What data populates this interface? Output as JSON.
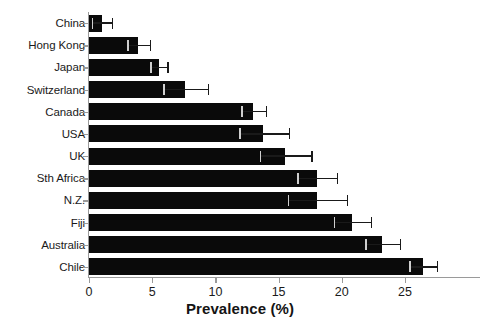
{
  "chart_data": {
    "type": "bar",
    "orientation": "horizontal",
    "title": "",
    "xlabel": "Prevalence (%)",
    "ylabel": "",
    "xlim": [
      0,
      28
    ],
    "ylim": null,
    "grid": false,
    "legend": null,
    "xticks": [
      0,
      5,
      10,
      15,
      20,
      25
    ],
    "xtick_labels": [
      "0",
      "5",
      "10",
      "15",
      "20",
      "25"
    ],
    "categories": [
      "China",
      "Hong Kong",
      "Japan",
      "Switzerland",
      "Canada",
      "USA",
      "UK",
      "Sth Africa",
      "N.Z.",
      "Fiji",
      "Australia",
      "Chile"
    ],
    "values": [
      1.0,
      3.9,
      5.5,
      7.6,
      13.0,
      13.8,
      15.5,
      18.0,
      18.0,
      20.8,
      23.2,
      26.4
    ],
    "error_high": [
      1.8,
      4.8,
      6.2,
      9.4,
      14.0,
      15.8,
      17.6,
      19.6,
      20.4,
      22.3,
      24.6,
      27.5
    ],
    "series_name": "Prevalence",
    "bar_color": "#0a0a0a",
    "axis_color": "#9a9a9a",
    "error_bar_color": "#1a1a1a",
    "background_color": "#ffffff"
  },
  "axis": {
    "x_title": "Prevalence (%)"
  }
}
